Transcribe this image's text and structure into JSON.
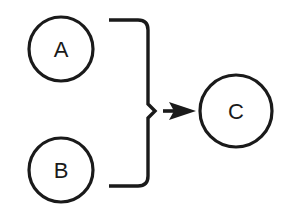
{
  "diagram": {
    "type": "merge-flow",
    "nodes": [
      {
        "id": "A",
        "label": "A",
        "cx": 61,
        "cy": 49,
        "r": 32
      },
      {
        "id": "B",
        "label": "B",
        "cx": 61,
        "cy": 170,
        "r": 32
      },
      {
        "id": "C",
        "label": "C",
        "cx": 236,
        "cy": 111,
        "r": 36
      }
    ],
    "connector": {
      "kind": "curly-brace",
      "groups": [
        "A",
        "B"
      ],
      "arrow_to": "C"
    },
    "colors": {
      "stroke": "#1a1a1a",
      "background": "#ffffff"
    }
  }
}
